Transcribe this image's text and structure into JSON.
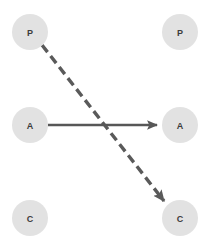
{
  "canvas": {
    "width": 206,
    "height": 243,
    "background_color": "#ffffff"
  },
  "style": {
    "node_fill": "#e2e2e2",
    "node_label_color": "#3c3c3c",
    "node_radius": 18,
    "solid_edge_color": "#575757",
    "solid_edge_width": 2.4,
    "dashed_edge_color": "#5a5a5a",
    "dashed_edge_width": 3.4,
    "dash_pattern": "9 5"
  },
  "nodes": [
    {
      "id": "p-left",
      "label": "P",
      "cx": 30,
      "cy": 32,
      "r": 18
    },
    {
      "id": "p-right",
      "label": "P",
      "cx": 180,
      "cy": 32,
      "r": 18
    },
    {
      "id": "a-left",
      "label": "A",
      "cx": 30,
      "cy": 125,
      "r": 18
    },
    {
      "id": "a-right",
      "label": "A",
      "cx": 180,
      "cy": 125,
      "r": 18
    },
    {
      "id": "c-left",
      "label": "C",
      "cx": 30,
      "cy": 218,
      "r": 18
    },
    {
      "id": "c-right",
      "label": "C",
      "cx": 180,
      "cy": 218,
      "r": 18
    }
  ],
  "edges": [
    {
      "id": "edge-a-to-a",
      "type": "solid",
      "from": "a-left",
      "to": "a-right",
      "x1": 48,
      "y1": 125,
      "x2": 157,
      "y2": 125,
      "color": "#575757",
      "width": 2.4,
      "arrowhead": "filled-triangle"
    },
    {
      "id": "edge-p-to-c",
      "type": "dashed",
      "from": "p-left",
      "to": "c-right",
      "x1": 42,
      "y1": 45,
      "x2": 164,
      "y2": 201,
      "color": "#5a5a5a",
      "width": 3.4,
      "dash": "9 5",
      "arrowhead": "filled-triangle"
    }
  ]
}
